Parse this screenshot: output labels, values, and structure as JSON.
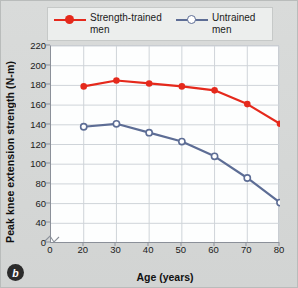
{
  "panel": {
    "label": "b"
  },
  "legend": {
    "position": "top",
    "entries": [
      {
        "name": "Strength-trained men",
        "line1": "Strength-trained",
        "line2": "men",
        "color": "#e5291c",
        "marker": "filled-circle"
      },
      {
        "name": "Untrained men",
        "line1": "Untrained",
        "line2": "men",
        "color": "#5d6d95",
        "marker": "open-circle"
      }
    ]
  },
  "chart_data": {
    "type": "line",
    "title": "",
    "xlabel": "Age (years)",
    "ylabel": "Peak knee extension strength (N-m)",
    "x": [
      20,
      30,
      40,
      50,
      60,
      70,
      80
    ],
    "xticks": [
      0,
      20,
      30,
      40,
      50,
      60,
      70,
      80
    ],
    "yticks": [
      0,
      40,
      60,
      80,
      100,
      120,
      140,
      160,
      180,
      200,
      220
    ],
    "xlim": [
      0,
      80
    ],
    "ylim": [
      40,
      220
    ],
    "y_axis_break": true,
    "grid": true,
    "series": [
      {
        "name": "Strength-trained men",
        "color": "#e5291c",
        "marker": "filled-circle",
        "values": [
          179,
          185,
          182,
          179,
          175,
          161,
          141
        ]
      },
      {
        "name": "Untrained men",
        "color": "#5d6d95",
        "marker": "open-circle",
        "values": [
          138,
          141,
          132,
          123,
          108,
          86,
          61
        ]
      }
    ]
  }
}
